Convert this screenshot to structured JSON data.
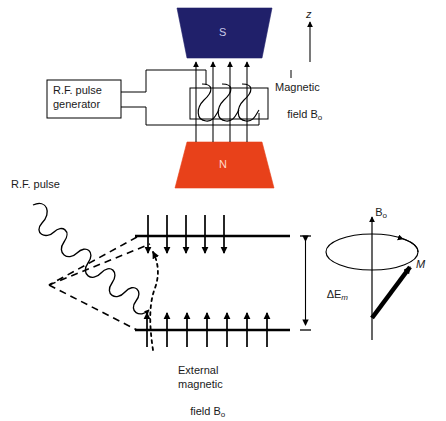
{
  "figure": {
    "type": "diagram"
  },
  "colors": {
    "south_pole_fill": "#20206a",
    "north_pole_fill": "#e8411a",
    "stroke": "#000000",
    "text": "#1a1a1a",
    "pole_label_s": "#c9c9e8",
    "pole_label_n": "#ffd9c9",
    "background": "#ffffff"
  },
  "apparatus": {
    "south_pole_label": "S",
    "north_pole_label": "N",
    "generator": {
      "line1": "R.F. pulse",
      "line2": "generator"
    },
    "magnetic_field_label": {
      "line1": "Magnetic",
      "line2_prefix": "field ",
      "line2_symbol": "B",
      "line2_subscript": "o"
    },
    "z_axis_label": "z",
    "field_line_count": 4,
    "coil_turns": 3
  },
  "energy_diagram": {
    "rf_pulse_label": "R.F. pulse",
    "energy_gap": {
      "delta": "Δ",
      "symbol": "E",
      "subscript": "m"
    },
    "upper_level_arrow_count": 5,
    "upper_level_arrow_direction": "down",
    "lower_level_arrow_count": 7,
    "lower_level_arrow_direction": "up",
    "external_field_label": {
      "line1": "External",
      "line2": "magnetic",
      "line3_prefix": "field ",
      "line3_symbol": "B",
      "line3_subscript": "o"
    }
  },
  "precession": {
    "axis_label_symbol": "B",
    "axis_label_subscript": "o",
    "magnetization_label": "M"
  }
}
